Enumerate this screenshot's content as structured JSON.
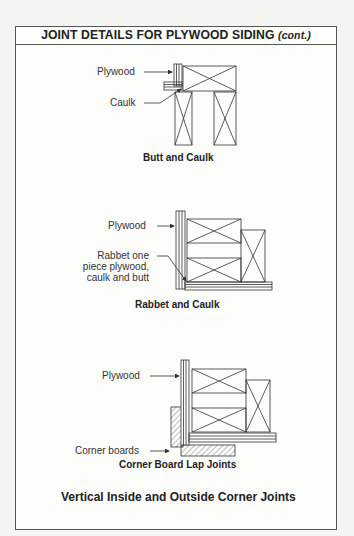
{
  "header": {
    "title": "JOINT DETAILS FOR PLYWOOD SIDING",
    "cont": "(cont.)"
  },
  "figures": [
    {
      "caption": "Butt and Caulk",
      "labels": [
        "Plywood",
        "Caulk"
      ]
    },
    {
      "caption": "Rabbet and Caulk",
      "labels": [
        "Plywood",
        "Rabbet one",
        "piece plywood,",
        "caulk and butt"
      ]
    },
    {
      "caption": "Corner Board Lap Joints",
      "labels": [
        "Plywood",
        "Corner boards"
      ]
    }
  ],
  "footer": {
    "title": "Vertical Inside and Outside Corner Joints"
  }
}
